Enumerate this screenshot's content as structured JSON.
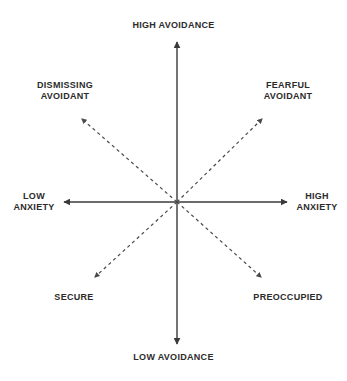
{
  "diagram": {
    "type": "quadrant-diagram",
    "background_color": "#ffffff",
    "text_color": "#2b2b2b",
    "axis_color": "#3a3a3a",
    "diagonal_color": "#4a4a4a",
    "axes": {
      "vertical": {
        "name": "avoidance",
        "high_label": "HIGH AVOIDANCE",
        "low_label": "LOW AVOIDANCE",
        "style": "solid",
        "arrowheads": "both"
      },
      "horizontal": {
        "name": "anxiety",
        "low_label": "LOW\nANXIETY",
        "high_label": "HIGH\nANXIETY",
        "style": "solid",
        "arrowheads": "both"
      }
    },
    "quadrants": [
      {
        "key": "dismissing-avoidant",
        "label": "DISMISSING\nAVOIDANT",
        "position": "top-left",
        "anxiety": "low",
        "avoidance": "high"
      },
      {
        "key": "fearful-avoidant",
        "label": "FEARFUL\nAVOIDANT",
        "position": "top-right",
        "anxiety": "high",
        "avoidance": "high"
      },
      {
        "key": "secure",
        "label": "SECURE",
        "position": "bottom-left",
        "anxiety": "low",
        "avoidance": "low"
      },
      {
        "key": "preoccupied",
        "label": "PREOCCUPIED",
        "position": "bottom-right",
        "anxiety": "high",
        "avoidance": "low"
      }
    ],
    "diagonals": {
      "style": "dashed",
      "arrowheads": "outward",
      "count": 4
    },
    "center": {
      "x": 177,
      "y": 202
    }
  }
}
